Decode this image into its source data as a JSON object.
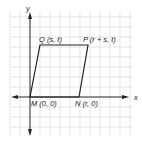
{
  "diagram": {
    "type": "coordinate-plane-parallelogram",
    "axes": {
      "x_label": "x",
      "y_label": "y"
    },
    "vertices": [
      {
        "name": "M",
        "label": "M (0, 0)"
      },
      {
        "name": "N",
        "label": "N (r, 0)"
      },
      {
        "name": "P",
        "label": "P (r + s, t)"
      },
      {
        "name": "Q",
        "label": "Q (s, t)"
      }
    ],
    "colors": {
      "grid": "#d9d9d9",
      "axis": "#222222",
      "shape": "#222222"
    }
  }
}
